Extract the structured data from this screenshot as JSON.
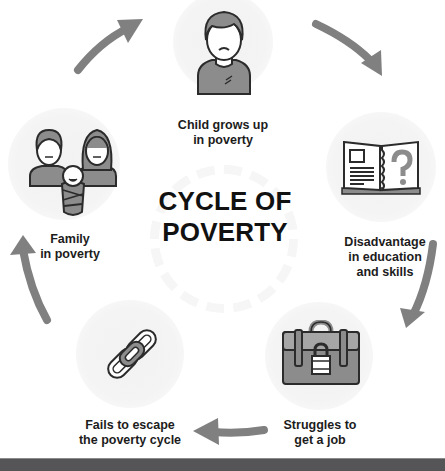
{
  "title": {
    "line1": "CYCLE OF",
    "line2": "POVERTY"
  },
  "stages": [
    {
      "id": "child",
      "icon": "child-icon",
      "line1": "Child grows up",
      "line2": "in poverty"
    },
    {
      "id": "education",
      "icon": "book-question-icon",
      "line1": "Disadvantage",
      "line2": "in education",
      "line3": "and skills"
    },
    {
      "id": "job",
      "icon": "locked-briefcase-icon",
      "line1": "Struggles to",
      "line2": "get a job"
    },
    {
      "id": "escape",
      "icon": "chain-link-icon",
      "line1": "Fails to escape",
      "line2": "the poverty cycle"
    },
    {
      "id": "family",
      "icon": "family-icon",
      "line1": "Family",
      "line2": "in poverty"
    }
  ],
  "colors": {
    "arrow": "#808080",
    "icon_fill": "#8c8c8c",
    "icon_stroke": "#2b2b2b",
    "circle_bg": "#f2f2f2",
    "footer": "#555557"
  }
}
